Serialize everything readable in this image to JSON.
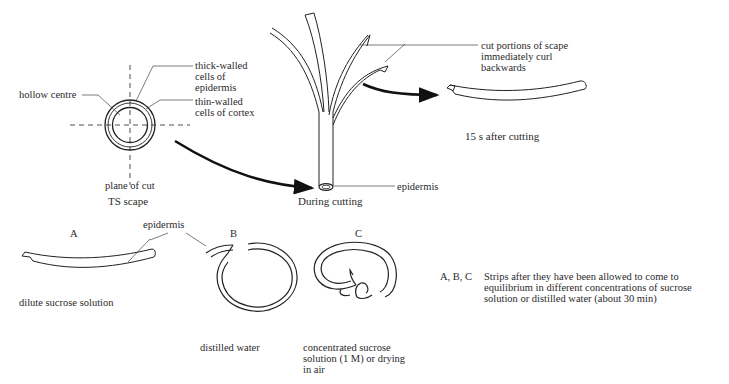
{
  "ts_section": {
    "label_hollow_centre": "hollow centre",
    "label_thick_walled": "thick-walled\ncells of\nepidermis",
    "label_thin_walled": "thin-walled\ncells of cortex",
    "label_plane_of_cut": "plane of cut",
    "caption": "TS scape"
  },
  "during_cutting": {
    "label_cut_portions": "cut portions of scape\nimmediately curl\nbackwards",
    "label_epidermis": "epidermis",
    "caption": "During cutting"
  },
  "after_cutting": {
    "caption": "15 s after cutting"
  },
  "strips": {
    "epidermis_label": "epidermis",
    "items": [
      {
        "letter": "A",
        "caption": "dilute sucrose solution"
      },
      {
        "letter": "B",
        "caption": "distilled water"
      },
      {
        "letter": "C",
        "caption": "concentrated sucrose\nsolution (1 M) or drying\nin air"
      }
    ],
    "legend_key": "A, B, C",
    "legend_text": "Strips after they have been allowed to come to\nequilibrium in different concentrations of sucrose\nsolution or distilled water (about 30 min)"
  }
}
